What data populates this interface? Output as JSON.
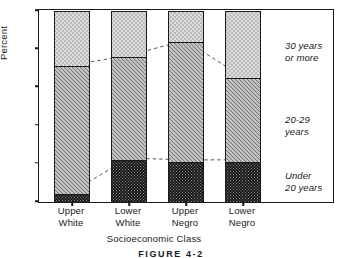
{
  "chart_data": {
    "type": "bar",
    "stacked": true,
    "title": "",
    "xlabel": "Socioeconomic Class",
    "ylabel": "Percent",
    "categories": [
      "Upper White",
      "Lower White",
      "Upper Negro",
      "Lower Negro"
    ],
    "category_lines": [
      [
        "Upper",
        "White"
      ],
      [
        "Lower",
        "White"
      ],
      [
        "Upper",
        "Negro"
      ],
      [
        "Lower",
        "Negro"
      ]
    ],
    "series": [
      {
        "name": "Under 20 years",
        "values": [
          4,
          22,
          21,
          21
        ]
      },
      {
        "name": "20-29 years",
        "values": [
          67,
          54,
          63,
          44
        ]
      },
      {
        "name": "30 years or more",
        "values": [
          29,
          24,
          16,
          35
        ]
      }
    ],
    "cumulative_tops": {
      "under_20": [
        4,
        22,
        21,
        21
      ],
      "through_29": [
        71,
        76,
        84,
        65
      ]
    },
    "ylim": [
      0,
      100
    ],
    "yticks": [
      0,
      20,
      40,
      60,
      80,
      100
    ],
    "ytick_labels": [
      "0",
      "20",
      "40",
      "60",
      "80",
      "100"
    ],
    "grid": false,
    "legend_position": "right-inside",
    "annotations": [
      {
        "id": "over30",
        "text": "30 years\nor more",
        "style": "italic"
      },
      {
        "id": "mid2029",
        "text": "20-29\nyears",
        "style": "italic"
      },
      {
        "id": "under20",
        "text": "Under\n20 years",
        "style": "italic"
      }
    ],
    "trend_lines": [
      {
        "id": "upper-trend",
        "connects": "top of 20-29 band",
        "values": [
          71,
          76,
          84,
          65
        ],
        "style": "dashed"
      },
      {
        "id": "lower-trend",
        "connects": "top of under-20 band",
        "values": [
          4,
          22,
          21,
          21
        ],
        "style": "dashed"
      }
    ],
    "colors": {
      "under_20": "#8e8e8e",
      "years_20_29": "#c2c2c2",
      "years_30_plus": "#dedede",
      "axis": "#1a1a1a",
      "background": "#ffffff"
    }
  },
  "caption": "FIGURE 4-2"
}
